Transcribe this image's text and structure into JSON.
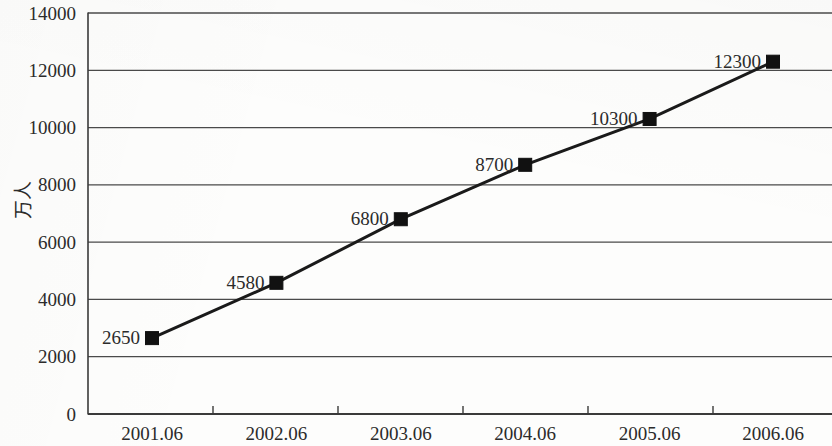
{
  "chart_data": {
    "type": "line",
    "title": "",
    "subtitle": "",
    "xlabel": "",
    "ylabel": "万人",
    "categories": [
      "2001.06",
      "2002.06",
      "2003.06",
      "2004.06",
      "2005.06",
      "2006.06"
    ],
    "values": [
      2650,
      4580,
      6800,
      8700,
      10300,
      12300
    ],
    "point_labels": [
      "2650",
      "4580",
      "6800",
      "8700",
      "10300",
      "12300"
    ],
    "series": [
      {
        "name": "",
        "values": [
          2650,
          4580,
          6800,
          8700,
          10300,
          12300
        ]
      }
    ],
    "ylim": [
      0,
      14000
    ],
    "ytick_values": [
      0,
      2000,
      4000,
      6000,
      8000,
      10000,
      12000,
      14000
    ],
    "ytick_labels": [
      "0",
      "2000",
      "4000",
      "6000",
      "8000",
      "10000",
      "12000",
      "14000"
    ],
    "grid": true,
    "grid_axis": "y",
    "legend": false,
    "legend_position": "none",
    "marker": "square",
    "marker_color": "#111111",
    "line_color": "#1a1a1a",
    "background_color": "#fdfdfc",
    "axis_color": "#3a3a3a",
    "grid_color": "#4a4a4a"
  },
  "geometry": {
    "plot_left": 88,
    "plot_right": 832,
    "plot_top": 13,
    "plot_bottom": 414,
    "point_x": [
      152,
      276.4,
      400.8,
      525.2,
      649.6,
      773
    ],
    "tick_x": [
      88,
      213,
      338,
      463,
      588,
      713
    ],
    "xlabel_x": [
      152,
      276.4,
      400.8,
      525.2,
      649.6,
      773
    ],
    "xlabel_y": 440,
    "ylabel_x": 30,
    "ylabel_y": 200
  }
}
